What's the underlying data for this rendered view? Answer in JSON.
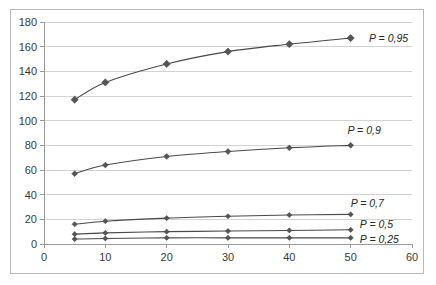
{
  "chart_data": {
    "type": "line",
    "title": "",
    "xlabel": "",
    "ylabel": "",
    "xlim": [
      0,
      60
    ],
    "ylim": [
      0,
      180
    ],
    "grid": true,
    "legend_position": "inline-right-of-last-point",
    "x_ticks": [
      "0",
      "10",
      "20",
      "30",
      "40",
      "50",
      "60"
    ],
    "x_tick_values": [
      0,
      10,
      20,
      30,
      40,
      50,
      60
    ],
    "y_ticks": [
      "0",
      "20",
      "40",
      "60",
      "80",
      "100",
      "120",
      "140",
      "160",
      "180"
    ],
    "y_tick_values": [
      0,
      20,
      40,
      60,
      80,
      100,
      120,
      140,
      160,
      180
    ],
    "x": [
      5,
      10,
      20,
      30,
      40,
      50
    ],
    "series": [
      {
        "name": "P = 0,95",
        "label": "P = 0,95",
        "values": [
          117,
          131,
          146,
          156,
          162,
          167
        ],
        "color": "#4a4a4a",
        "marker": "diamond"
      },
      {
        "name": "P = 0,9",
        "label": "P = 0,9",
        "values": [
          57,
          64,
          71,
          75,
          78,
          80
        ],
        "color": "#4a4a4a",
        "marker": "diamond"
      },
      {
        "name": "P = 0,7",
        "label": "P = 0,7",
        "values": [
          16,
          18.5,
          21,
          22.5,
          23.5,
          24
        ],
        "color": "#4a4a4a",
        "marker": "diamond"
      },
      {
        "name": "P = 0,5",
        "label": "P = 0,5",
        "values": [
          8,
          9,
          10,
          10.5,
          11,
          11.5
        ],
        "color": "#4a4a4a",
        "marker": "diamond"
      },
      {
        "name": "P = 0,25",
        "label": "P = 0,25",
        "values": [
          4,
          4.5,
          5,
          5,
          5,
          5
        ],
        "color": "#4a4a4a",
        "marker": "diamond"
      }
    ],
    "series_label_positions": [
      {
        "label": "P = 0,95",
        "x": 53.0,
        "y": 167
      },
      {
        "label": "P = 0,9",
        "x": 49.5,
        "y": 92
      },
      {
        "label": "P = 0,7",
        "x": 50.0,
        "y": 33
      },
      {
        "label": "P = 0,5",
        "x": 51.5,
        "y": 16
      },
      {
        "label": "P = 0,25",
        "x": 51.5,
        "y": 4
      }
    ],
    "colors": {
      "grid": "#d3d3d3",
      "axis": "#9a9a9a",
      "line": "#4a4a4a",
      "marker": "#555555",
      "border": "#b9b9b9",
      "text": "#3a3a3a",
      "background": "#ffffff"
    }
  }
}
